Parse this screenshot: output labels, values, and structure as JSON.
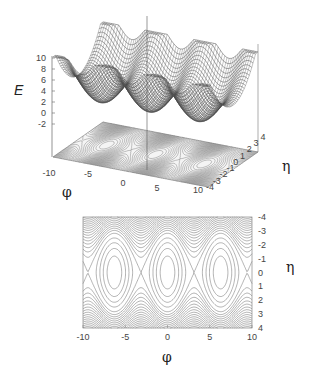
{
  "chart_data": [
    {
      "type": "surface",
      "title": "",
      "function": "E(phi, eta) = eta^2/2 + 2*(1 - cos(phi))",
      "xlabel": "φ",
      "ylabel": "η",
      "zlabel": "E",
      "xlim": [
        -10,
        10
      ],
      "ylim": [
        -4,
        4
      ],
      "zlim": [
        -2,
        10
      ],
      "xticks": [
        "-10",
        "-5",
        "0",
        "5",
        "10"
      ],
      "yticks": [
        "-4",
        "-3",
        "-2",
        "-1",
        "0",
        "1",
        "2",
        "3",
        "4"
      ],
      "zticks": [
        "10",
        "8",
        "6",
        "4",
        "2",
        "0",
        "-2"
      ],
      "base_contours": true,
      "minima_phi": [
        -6.283,
        0,
        6.283
      ]
    },
    {
      "type": "contour",
      "title": "",
      "xlabel": "φ",
      "ylabel": "η",
      "xlim": [
        -10,
        10
      ],
      "ylim": [
        4,
        -4
      ],
      "xticks": [
        "-10",
        "-5",
        "0",
        "5",
        "10"
      ],
      "yticks": [
        "-4",
        "-3",
        "-2",
        "-1",
        "0",
        "1",
        "2",
        "3",
        "4"
      ],
      "island_centers_phi": [
        -6.283,
        0,
        6.283
      ],
      "separatrix_crossings_phi": [
        -9.425,
        -3.142,
        3.142,
        9.425
      ],
      "levels": 30
    }
  ],
  "labels": {
    "surface_z": "E",
    "surface_x": "φ",
    "surface_y": "η",
    "contour_x": "φ",
    "contour_y": "η"
  }
}
